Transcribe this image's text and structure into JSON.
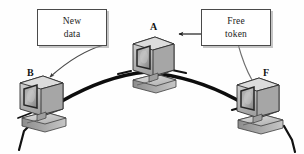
{
  "diagram": {
    "type": "token-ring-network",
    "background_color": "#fefefe",
    "callouts": [
      {
        "id": "new-data",
        "line1": "New",
        "line2": "data",
        "points_to": "B"
      },
      {
        "id": "free-token",
        "line1": "Free",
        "line2": "token",
        "points_to": "A"
      }
    ],
    "nodes": [
      {
        "id": "A",
        "label": "A",
        "icon": "crt-computer-icon",
        "position": "top-center"
      },
      {
        "id": "B",
        "label": "B",
        "icon": "crt-computer-icon",
        "position": "bottom-left"
      },
      {
        "id": "F",
        "label": "F",
        "icon": "crt-computer-icon",
        "position": "bottom-right"
      }
    ],
    "links": [
      {
        "id": "arc-a-b",
        "from": "A",
        "to": "B",
        "style": "thick-arc",
        "color": "#0d0d0d"
      },
      {
        "id": "arc-a-f",
        "from": "A",
        "to": "F",
        "style": "thick-arc",
        "color": "#0d0d0d"
      }
    ],
    "annotation_arrows": [
      {
        "id": "arrow-new-data-to-b",
        "from": "new-data",
        "to": "B",
        "style": "thin-curved-arrow",
        "color": "#4a4a4a"
      },
      {
        "id": "arrow-free-token-to-a",
        "from": "free-token",
        "to": "A",
        "style": "thin-straight-arrow",
        "color": "#1c1c1c"
      },
      {
        "id": "curve-free-token-to-f",
        "from": "free-token",
        "to": "F",
        "style": "thin-curve",
        "color": "#6e6e6e"
      }
    ]
  }
}
